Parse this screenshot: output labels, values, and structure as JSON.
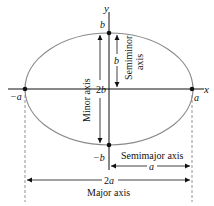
{
  "diagram": {
    "type": "ellipse-axes",
    "colors": {
      "ellipse": "#8a8a8a",
      "axes": "#111111",
      "dashes": "#777777"
    },
    "axes": {
      "x_label": "x",
      "y_label": "y"
    },
    "points": {
      "left_vertex": "−a",
      "right_vertex": "a",
      "top_covertex": "b",
      "bottom_covertex": "−b"
    },
    "dimensions": {
      "semiminor_value": "b",
      "semiminor_label": "Semiminor axis",
      "semiminor_line1": "Semiminor",
      "semiminor_line2": "axis",
      "minor_value": "2b",
      "minor_label": "Minor axis",
      "semimajor_value": "a",
      "semimajor_label": "Semimajor axis",
      "major_value": "2a",
      "major_label": "Major axis"
    }
  }
}
